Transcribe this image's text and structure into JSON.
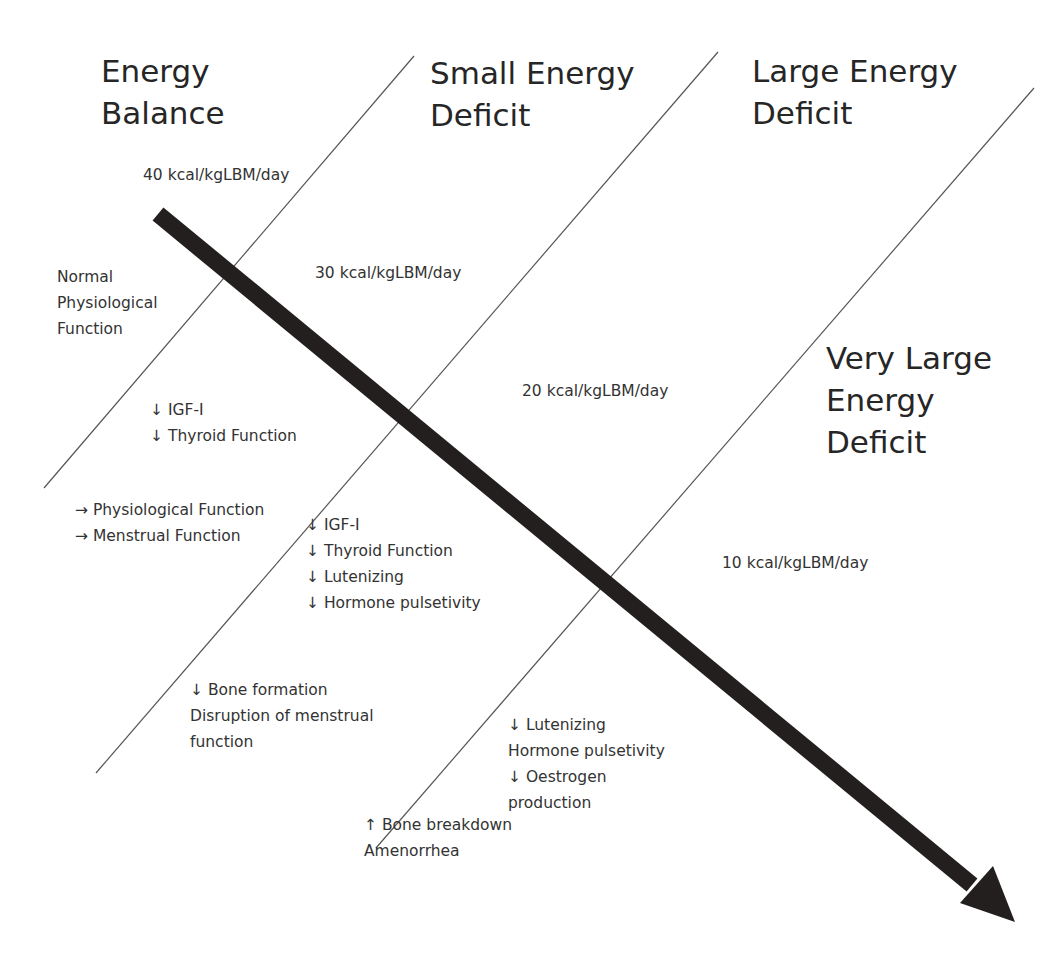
{
  "diagram": {
    "zones": [
      {
        "id": "energy-balance",
        "heading": [
          "Energy",
          "Balance"
        ]
      },
      {
        "id": "small-energy-deficit",
        "heading": [
          "Small Energy",
          "Deficit"
        ]
      },
      {
        "id": "large-energy-deficit",
        "heading": [
          "Large Energy",
          "Deficit"
        ]
      },
      {
        "id": "very-large-energy-deficit",
        "heading": [
          "Very Large",
          "Energy",
          "Deficit"
        ]
      }
    ],
    "thresholds": [
      {
        "label": "40 kcal/kgLBM/day"
      },
      {
        "label": "30 kcal/kgLBM/day"
      },
      {
        "label": "20 kcal/kgLBM/day"
      },
      {
        "label": "10 kcal/kgLBM/day"
      }
    ],
    "effects": {
      "normal": [
        "Normal",
        "Physiological",
        "Function"
      ],
      "small_upper": [
        "↓ IGF-I",
        "↓ Thyroid Function"
      ],
      "small_lower": [
        "→ Physiological Function",
        "→ Menstrual Function"
      ],
      "large_upper": [
        "↓ IGF-I",
        "↓ Thyroid Function",
        "↓ Lutenizing",
        "↓ Hormone pulsetivity"
      ],
      "large_lower": [
        "↓ Bone formation",
        "Disruption of menstrual",
        "function"
      ],
      "very_large_upper": [
        "↓ Lutenizing",
        "Hormone pulsetivity",
        "↓ Oestrogen",
        "production"
      ],
      "very_large_lower": [
        "↑ Bone breakdown",
        "Amenorrhea"
      ]
    },
    "arrow": {
      "direction": "decreasing energy availability",
      "color": "#231f1f"
    },
    "divider_color": "#555555"
  }
}
